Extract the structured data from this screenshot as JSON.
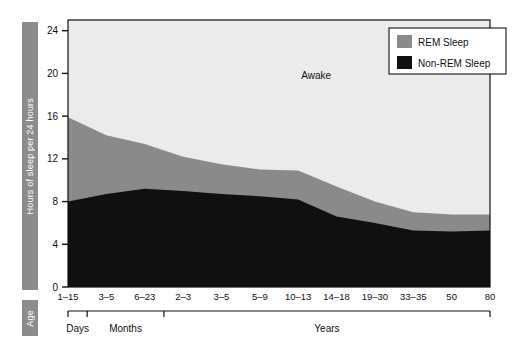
{
  "axes": {
    "y_title": "Hours of sleep per 24 hours",
    "x_title": "Age",
    "y_ticks": [
      0,
      4,
      8,
      12,
      16,
      20,
      24
    ],
    "y_range": [
      0,
      25
    ],
    "x_tick_labels": [
      "1–15",
      "3–5",
      "6–23",
      "2–3",
      "3–5",
      "5–9",
      "10–13",
      "14–18",
      "19–30",
      "33–35",
      "50",
      "80"
    ],
    "x_groups": [
      {
        "label": "Days",
        "start_index": 0,
        "end_index": 0
      },
      {
        "label": "Months",
        "start_index": 1,
        "end_index": 2
      },
      {
        "label": "Years",
        "start_index": 3,
        "end_index": 11
      }
    ]
  },
  "legend": {
    "items": [
      {
        "label": "REM Sleep",
        "color": "#8a8a8a"
      },
      {
        "label": "Non-REM Sleep",
        "color": "#101010"
      }
    ]
  },
  "annotations": {
    "awake_label": "Awake"
  },
  "colors": {
    "awake": "#ebebeb",
    "rem": "#8a8a8a",
    "non_rem": "#101010",
    "band": "#8c8c8c",
    "axis": "#111111",
    "plot_border": "#111111",
    "legend_bg": "#ffffff"
  },
  "chart_data": {
    "type": "area",
    "title": "",
    "xlabel": "Age",
    "ylabel": "Hours of sleep per 24 hours",
    "ylim": [
      0,
      25
    ],
    "grid": false,
    "legend_position": "top-right",
    "stacked": true,
    "categories": [
      "1–15",
      "3–5",
      "6–23",
      "2–3",
      "3–5",
      "5–9",
      "10–13",
      "14–18",
      "19–30",
      "33–35",
      "50",
      "80"
    ],
    "category_groups": [
      "Days",
      "Months",
      "Months",
      "Years",
      "Years",
      "Years",
      "Years",
      "Years",
      "Years",
      "Years",
      "Years",
      "Years"
    ],
    "series": [
      {
        "name": "Non-REM Sleep",
        "color": "#101010",
        "values": [
          8.0,
          8.7,
          9.2,
          9.0,
          8.7,
          8.5,
          8.2,
          6.6,
          6.0,
          5.3,
          5.2,
          5.3
        ]
      },
      {
        "name": "REM Sleep",
        "color": "#8a8a8a",
        "values": [
          7.9,
          5.5,
          4.2,
          3.2,
          2.8,
          2.5,
          2.7,
          2.8,
          2.0,
          1.7,
          1.6,
          1.5
        ]
      },
      {
        "name": "Awake",
        "color": "#ebebeb",
        "values": [
          8.1,
          9.8,
          10.6,
          11.8,
          12.5,
          13.0,
          13.1,
          14.6,
          16.0,
          17.0,
          17.2,
          17.2
        ]
      }
    ],
    "total_sleep": [
      15.9,
      14.2,
      13.4,
      12.2,
      11.5,
      11.0,
      10.9,
      9.4,
      8.0,
      7.0,
      6.8,
      6.8
    ],
    "annotations": [
      {
        "text": "Awake",
        "x_index": 6,
        "y": 19.5
      }
    ]
  }
}
